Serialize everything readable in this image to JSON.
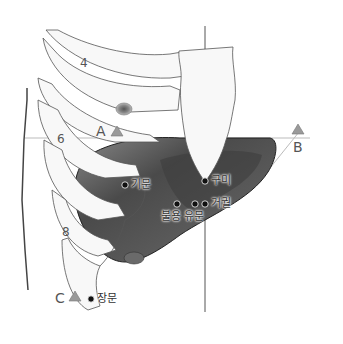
{
  "diagram": {
    "rib_labels": [
      "4",
      "6",
      "8"
    ],
    "landmarks": [
      {
        "id": "A",
        "label": "A"
      },
      {
        "id": "B",
        "label": "B"
      },
      {
        "id": "C",
        "label": "C"
      }
    ],
    "points": [
      {
        "id": "gimun",
        "label": "기문"
      },
      {
        "id": "gumi",
        "label": "구미"
      },
      {
        "id": "burong",
        "label": "불용"
      },
      {
        "id": "yumun",
        "label": "유문"
      },
      {
        "id": "geogwol",
        "label": "거궐"
      },
      {
        "id": "jangmun",
        "label": "장문"
      }
    ],
    "colors": {
      "outline": "#555555",
      "bone_fill": "#f7f7f7",
      "liver_dark": "#3a3a3a",
      "liver_mid": "#6e6e6e",
      "marker": "#9a9a9a",
      "guide_line": "#b5b5b5",
      "point_dot": "#111111"
    }
  }
}
